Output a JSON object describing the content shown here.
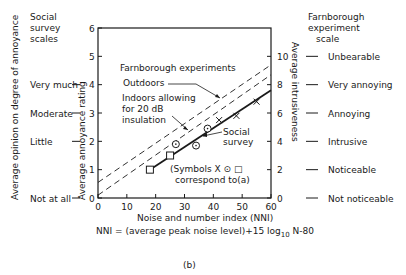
{
  "chart_data": {
    "type": "line",
    "panel_label": "(b)",
    "xlabel": "Noise and number index (NNI)",
    "formula": "NNI = (average peak noise level) + 15 log10 N - 80",
    "formula_parts": {
      "pre": "NNI = (average peak noise level)+15 log",
      "sub": "10",
      "post": " N-80"
    },
    "ylabel_left": "Average annoyance rating",
    "ylabel_right": "Average intrusiveness",
    "ylabel_far_left": "Average opinion on degree of annoyance",
    "x_ticks": [
      "0",
      "10",
      "20",
      "30",
      "40",
      "50",
      "60"
    ],
    "xlim": [
      0,
      60
    ],
    "y_ticks_left": [
      "0",
      "1",
      "2",
      "3",
      "4",
      "5",
      "6"
    ],
    "ylim_left": [
      0,
      6
    ],
    "y_ticks_right": [
      "0",
      "2",
      "4",
      "6",
      "8",
      "10"
    ],
    "ylim_right": [
      0,
      12
    ],
    "social_survey_scale": {
      "title": [
        "Social",
        "survey",
        "scales"
      ],
      "levels": [
        {
          "label": "Very much",
          "value": 4
        },
        {
          "label": "Moderate",
          "value": 3
        },
        {
          "label": "Little",
          "value": 2
        },
        {
          "label": "Not at all",
          "value": 0
        }
      ]
    },
    "farnborough_scale": {
      "title": [
        "Farnborough",
        "experiment",
        "scale"
      ],
      "levels": [
        {
          "label": "Unbearable",
          "value": 10
        },
        {
          "label": "Very annoying",
          "value": 8
        },
        {
          "label": "Annoying",
          "value": 6
        },
        {
          "label": "Intrusive",
          "value": 4
        },
        {
          "label": "Noticeable",
          "value": 2
        },
        {
          "label": "Not noticeable",
          "value": 0
        }
      ]
    },
    "series": [
      {
        "name": "Farnborough experiments - Outdoors",
        "style": "dashed",
        "x": [
          0,
          60
        ],
        "y": [
          0.55,
          4.7
        ]
      },
      {
        "name": "Farnborough experiments - Indoors allowing for 20 dB insulation",
        "style": "dashed",
        "x": [
          0,
          60
        ],
        "y": [
          0.1,
          4.35
        ]
      },
      {
        "name": "Social survey",
        "style": "solid",
        "x": [
          18,
          60
        ],
        "y": [
          1.0,
          3.8
        ]
      }
    ],
    "points": [
      {
        "symbol": "square",
        "x": 18,
        "y": 1.0
      },
      {
        "symbol": "square",
        "x": 25,
        "y": 1.5
      },
      {
        "symbol": "circle-dot",
        "x": 27,
        "y": 1.9
      },
      {
        "symbol": "circle-dot",
        "x": 34,
        "y": 1.85
      },
      {
        "symbol": "circle-dot",
        "x": 38,
        "y": 2.45
      },
      {
        "symbol": "cross",
        "x": 42,
        "y": 2.75
      },
      {
        "symbol": "cross",
        "x": 48,
        "y": 2.9
      },
      {
        "symbol": "cross",
        "x": 55,
        "y": 3.4
      }
    ],
    "annotations": {
      "farnborough": "Farnborough experiments",
      "outdoors": "Outdoors",
      "indoors": [
        "Indoors allowing",
        "for 20 dB",
        "insulation"
      ],
      "social": [
        "Social",
        "survey"
      ],
      "symbols_note": [
        "(Symbols X ⊙ □",
        "correspond to(a)"
      ]
    },
    "grid": false
  }
}
